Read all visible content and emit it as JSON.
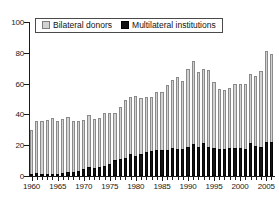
{
  "chart_data": {
    "type": "bar",
    "title": "",
    "subtitle": "",
    "xlabel": "",
    "ylabel": "",
    "ylim": [
      0,
      100
    ],
    "yticks": [
      0,
      20,
      40,
      60,
      80,
      100
    ],
    "xlim": [
      1960,
      2006
    ],
    "xticks": [
      1960,
      1965,
      1970,
      1975,
      1980,
      1985,
      1990,
      1995,
      2000,
      2005
    ],
    "grid": false,
    "stacked": true,
    "legend_position": "top-left",
    "categories": [
      1960,
      1961,
      1962,
      1963,
      1964,
      1965,
      1966,
      1967,
      1968,
      1969,
      1970,
      1971,
      1972,
      1973,
      1974,
      1975,
      1976,
      1977,
      1978,
      1979,
      1980,
      1981,
      1982,
      1983,
      1984,
      1985,
      1986,
      1987,
      1988,
      1989,
      1990,
      1991,
      1992,
      1993,
      1994,
      1995,
      1996,
      1997,
      1998,
      1999,
      2000,
      2001,
      2002,
      2003,
      2004,
      2005,
      2006
    ],
    "series": [
      {
        "name": "Bilateral donors",
        "color": "#d2d2d2",
        "values": [
          28.5,
          33.5,
          34.5,
          35.0,
          36.0,
          34.5,
          35.0,
          35.5,
          33.0,
          32.5,
          32.0,
          33.5,
          31.5,
          31.5,
          34.5,
          33.0,
          30.5,
          34.0,
          37.5,
          37.0,
          39.0,
          36.0,
          35.5,
          35.5,
          37.5,
          37.5,
          42.0,
          44.5,
          46.5,
          44.5,
          50.5,
          54.0,
          48.5,
          48.0,
          50.0,
          43.0,
          39.0,
          38.5,
          39.0,
          41.5,
          41.5,
          42.0,
          44.5,
          45.5,
          49.5,
          59.0,
          57.5
        ]
      },
      {
        "name": "Multilateral institutions",
        "color": "#151515",
        "values": [
          1.5,
          2.0,
          1.5,
          1.5,
          1.5,
          1.5,
          2.0,
          2.5,
          2.5,
          3.0,
          4.5,
          6.0,
          5.5,
          6.0,
          6.5,
          8.0,
          10.5,
          11.0,
          12.0,
          14.0,
          13.0,
          14.5,
          15.5,
          16.0,
          17.0,
          17.0,
          17.0,
          18.0,
          17.5,
          17.5,
          19.0,
          20.5,
          19.0,
          21.5,
          19.0,
          18.0,
          17.5,
          17.5,
          18.0,
          18.0,
          18.5,
          17.5,
          21.5,
          19.5,
          19.0,
          22.0,
          22.0
        ]
      }
    ],
    "totals": [
      30,
      35.5,
      36,
      36.5,
      37.5,
      36,
      37,
      38,
      35.5,
      35.5,
      36.5,
      39.5,
      37,
      37.5,
      41,
      41,
      41,
      45,
      49.5,
      51,
      52,
      50.5,
      51,
      51.5,
      54.5,
      54.5,
      59,
      62.5,
      64,
      62,
      69.5,
      74.5,
      67.5,
      69.5,
      69,
      61,
      56.5,
      56,
      57,
      59.5,
      60,
      59.5,
      66,
      65,
      68.5,
      81,
      79.5
    ]
  },
  "legend": {
    "items": [
      {
        "label": "Bilateral donors",
        "swatch": "bilateral-swatch"
      },
      {
        "label": "Multilateral institutions",
        "swatch": "multilateral-swatch"
      }
    ]
  }
}
